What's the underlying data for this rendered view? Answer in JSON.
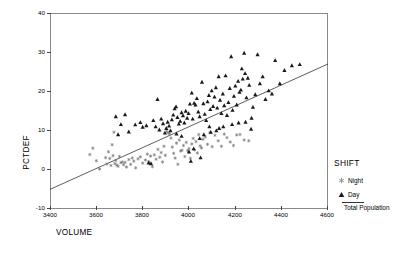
{
  "chart_data": {
    "type": "scatter",
    "title": "",
    "xlabel": "VOLUME",
    "ylabel": "PCTDEF",
    "xlim": [
      3400,
      4600
    ],
    "ylim": [
      -10,
      40
    ],
    "xticks": [
      3400,
      3600,
      3800,
      4000,
      4200,
      4400,
      4600
    ],
    "xtick_labels": [
      "3400",
      "3600",
      "3800",
      "4000",
      "4200",
      "4400",
      "4600"
    ],
    "yticks": [
      -10,
      0,
      10,
      20,
      30,
      40
    ],
    "ytick_labels": [
      "-10",
      "0",
      "10",
      "20",
      "30",
      "40"
    ],
    "grid": false,
    "legend_position": "right",
    "legend_title": "SHIFT",
    "series": [
      {
        "name": "Night",
        "marker": "asterisk",
        "color": "#7a7a7a",
        "points": [
          [
            3572,
            3.9
          ],
          [
            3585,
            5.5
          ],
          [
            3600,
            2.3
          ],
          [
            3614,
            0.2
          ],
          [
            3640,
            3.1
          ],
          [
            3646,
            1.5
          ],
          [
            3652,
            4.6
          ],
          [
            3658,
            2.9
          ],
          [
            3663,
            1.1
          ],
          [
            3668,
            6.4
          ],
          [
            3672,
            3.6
          ],
          [
            3676,
            9.6
          ],
          [
            3680,
            1.6
          ],
          [
            3684,
            2.4
          ],
          [
            3688,
            1.2
          ],
          [
            3694,
            0.9
          ],
          [
            3700,
            3.4
          ],
          [
            3706,
            1.8
          ],
          [
            3712,
            2.0
          ],
          [
            3718,
            1.3
          ],
          [
            3724,
            1.9
          ],
          [
            3730,
            0.7
          ],
          [
            3740,
            2.6
          ],
          [
            3748,
            1.4
          ],
          [
            3755,
            3.0
          ],
          [
            3762,
            2.2
          ],
          [
            3770,
            0.5
          ],
          [
            3780,
            2.8
          ],
          [
            3790,
            3.3
          ],
          [
            3800,
            1.7
          ],
          [
            3812,
            2.5
          ],
          [
            3820,
            4.0
          ],
          [
            3826,
            2.1
          ],
          [
            3834,
            3.5
          ],
          [
            3842,
            0.8
          ],
          [
            3850,
            3.8
          ],
          [
            3858,
            2.7
          ],
          [
            3866,
            5.2
          ],
          [
            3874,
            3.2
          ],
          [
            3880,
            4.4
          ],
          [
            3886,
            2.0
          ],
          [
            3892,
            6.0
          ],
          [
            3898,
            3.7
          ],
          [
            3904,
            9.8
          ],
          [
            3910,
            9.4
          ],
          [
            3916,
            9.2
          ],
          [
            3922,
            8.1
          ],
          [
            3928,
            5.8
          ],
          [
            3934,
            4.2
          ],
          [
            3940,
            3.0
          ],
          [
            3946,
            6.8
          ],
          [
            3952,
            1.4
          ],
          [
            3958,
            7.6
          ],
          [
            3964,
            4.8
          ],
          [
            3970,
            5.0
          ],
          [
            3976,
            6.2
          ],
          [
            3982,
            3.4
          ],
          [
            3988,
            7.0
          ],
          [
            3994,
            4.9
          ],
          [
            4000,
            5.4
          ],
          [
            4006,
            2.9
          ],
          [
            4012,
            6.6
          ],
          [
            4018,
            8.0
          ],
          [
            4024,
            5.1
          ],
          [
            4030,
            7.2
          ],
          [
            4036,
            4.3
          ],
          [
            4042,
            9.0
          ],
          [
            4048,
            6.1
          ],
          [
            4054,
            5.6
          ],
          [
            4060,
            7.8
          ],
          [
            4070,
            8.4
          ],
          [
            4080,
            6.5
          ],
          [
            4090,
            9.5
          ],
          [
            4100,
            5.9
          ],
          [
            4112,
            8.8
          ],
          [
            4126,
            7.4
          ],
          [
            4140,
            6.0
          ],
          [
            4152,
            9.1
          ],
          [
            4164,
            8.2
          ],
          [
            4178,
            7.1
          ],
          [
            4192,
            6.2
          ],
          [
            4206,
            8.9
          ],
          [
            4220,
            9.0
          ],
          [
            4238,
            7.6
          ],
          [
            4258,
            7.4
          ]
        ]
      },
      {
        "name": "Day",
        "marker": "triangle",
        "color": "#1a1a1a",
        "points": [
          [
            3684,
            13.6
          ],
          [
            3694,
            9.0
          ],
          [
            3706,
            11.6
          ],
          [
            3724,
            14.1
          ],
          [
            3740,
            9.7
          ],
          [
            3768,
            11.5
          ],
          [
            3790,
            12.1
          ],
          [
            3800,
            10.9
          ],
          [
            3816,
            11.3
          ],
          [
            3826,
            1.8
          ],
          [
            3836,
            1.6
          ],
          [
            3846,
            12.6
          ],
          [
            3856,
            11.0
          ],
          [
            3864,
            18.0
          ],
          [
            3872,
            10.2
          ],
          [
            3880,
            13.0
          ],
          [
            3888,
            11.8
          ],
          [
            3896,
            9.4
          ],
          [
            3902,
            10.6
          ],
          [
            3908,
            12.2
          ],
          [
            3914,
            11.2
          ],
          [
            3920,
            10.0
          ],
          [
            3926,
            12.8
          ],
          [
            3932,
            14.0
          ],
          [
            3938,
            15.6
          ],
          [
            3944,
            16.1
          ],
          [
            3950,
            13.4
          ],
          [
            3956,
            11.7
          ],
          [
            3962,
            12.4
          ],
          [
            3968,
            14.6
          ],
          [
            3974,
            13.8
          ],
          [
            3980,
            12.0
          ],
          [
            3986,
            15.0
          ],
          [
            3992,
            13.2
          ],
          [
            3998,
            14.4
          ],
          [
            4004,
            16.8
          ],
          [
            4008,
            2.2
          ],
          [
            4012,
            19.6
          ],
          [
            4016,
            13.0
          ],
          [
            4022,
            17.0
          ],
          [
            4028,
            16.6
          ],
          [
            4034,
            18.2
          ],
          [
            4040,
            14.8
          ],
          [
            4046,
            13.6
          ],
          [
            4050,
            3.1
          ],
          [
            4056,
            22.4
          ],
          [
            4062,
            16.9
          ],
          [
            4068,
            14.2
          ],
          [
            4074,
            12.6
          ],
          [
            4080,
            17.4
          ],
          [
            4086,
            19.0
          ],
          [
            4092,
            15.4
          ],
          [
            4098,
            20.2
          ],
          [
            4104,
            16.2
          ],
          [
            4110,
            18.6
          ],
          [
            4116,
            21.0
          ],
          [
            4122,
            15.8
          ],
          [
            4128,
            23.8
          ],
          [
            4134,
            17.8
          ],
          [
            4140,
            14.4
          ],
          [
            4146,
            19.4
          ],
          [
            4152,
            16.4
          ],
          [
            4158,
            24.0
          ],
          [
            4164,
            13.9
          ],
          [
            4170,
            17.2
          ],
          [
            4176,
            20.8
          ],
          [
            4182,
            28.9
          ],
          [
            4188,
            15.2
          ],
          [
            4194,
            18.8
          ],
          [
            4200,
            21.4
          ],
          [
            4206,
            16.6
          ],
          [
            4212,
            22.6
          ],
          [
            4218,
            19.8
          ],
          [
            4224,
            20.4
          ],
          [
            4228,
            25.8
          ],
          [
            4232,
            23.2
          ],
          [
            4238,
            29.8
          ],
          [
            4242,
            24.6
          ],
          [
            4248,
            18.4
          ],
          [
            4254,
            23.4
          ],
          [
            4260,
            21.6
          ],
          [
            4268,
            10.4
          ],
          [
            4276,
            16.0
          ],
          [
            4286,
            19.2
          ],
          [
            4296,
            29.4
          ],
          [
            4306,
            22.0
          ],
          [
            4318,
            23.8
          ],
          [
            4330,
            18.0
          ],
          [
            4344,
            20.2
          ],
          [
            4358,
            19.4
          ],
          [
            4372,
            27.9
          ],
          [
            4392,
            22.0
          ],
          [
            4412,
            25.4
          ],
          [
            4444,
            26.6
          ],
          [
            4478,
            26.9
          ],
          [
            4094,
            9.6
          ],
          [
            4118,
            10.0
          ],
          [
            4148,
            11.0
          ],
          [
            4186,
            11.6
          ],
          [
            4214,
            12.0
          ],
          [
            4244,
            12.2
          ],
          [
            4270,
            13.2
          ],
          [
            3946,
            9.2
          ],
          [
            3968,
            8.6
          ],
          [
            4000,
            4.6
          ],
          [
            4020,
            5.4
          ],
          [
            4046,
            8.0
          ],
          [
            4064,
            9.0
          ],
          [
            4088,
            11.0
          ],
          [
            4130,
            10.6
          ]
        ]
      }
    ],
    "trendline": {
      "name": "Total Population",
      "color": "#333333",
      "x0": 3400,
      "y0": -5.0,
      "x1": 4600,
      "y1": 27.0
    }
  }
}
